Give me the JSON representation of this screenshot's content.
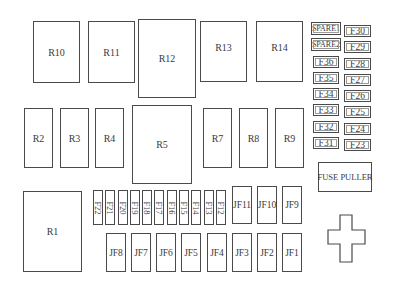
{
  "diagram": {
    "relays": [
      {
        "id": "R10",
        "x": 33,
        "y": 21,
        "w": 47,
        "h": 62
      },
      {
        "id": "R11",
        "x": 88,
        "y": 21,
        "w": 47,
        "h": 62
      },
      {
        "id": "R12",
        "x": 138,
        "y": 19,
        "w": 58,
        "h": 79
      },
      {
        "id": "R13",
        "x": 200,
        "y": 21,
        "w": 47,
        "h": 61
      },
      {
        "id": "R14",
        "x": 256,
        "y": 21,
        "w": 47,
        "h": 61
      },
      {
        "id": "R2",
        "x": 24,
        "y": 108,
        "w": 29,
        "h": 60
      },
      {
        "id": "R3",
        "x": 60,
        "y": 108,
        "w": 29,
        "h": 60
      },
      {
        "id": "R4",
        "x": 95,
        "y": 108,
        "w": 29,
        "h": 60
      },
      {
        "id": "R5",
        "x": 132,
        "y": 105,
        "w": 60,
        "h": 79
      },
      {
        "id": "R7",
        "x": 203,
        "y": 108,
        "w": 29,
        "h": 60
      },
      {
        "id": "R8",
        "x": 239,
        "y": 108,
        "w": 29,
        "h": 60
      },
      {
        "id": "R9",
        "x": 275,
        "y": 108,
        "w": 29,
        "h": 60
      },
      {
        "id": "R1",
        "x": 23,
        "y": 191,
        "w": 59,
        "h": 81
      }
    ],
    "mini_fuses_left_column": [
      "SPARE1",
      "SPARE2",
      "F36",
      "F35",
      "F34",
      "F33",
      "F32",
      "F31"
    ],
    "mini_fuses_right_column": [
      "F30",
      "F29",
      "F28",
      "F27",
      "F26",
      "F25",
      "F24",
      "F23"
    ],
    "vertical_fuses": [
      "F22",
      "F21",
      "F20",
      "F19",
      "F18",
      "F17",
      "F16",
      "F15",
      "F14",
      "F13",
      "F12"
    ],
    "jcase_fuses_top": [
      "JF11",
      "JF10",
      "JF9"
    ],
    "jcase_fuses_bottom": [
      "JF8",
      "JF7",
      "JF6",
      "JF5",
      "JF4",
      "JF3",
      "JF2",
      "JF1"
    ],
    "fuse_puller_label": "FUSE PULLER",
    "cross_shape": "plus-shaped-slot"
  },
  "labels": {
    "R10": "R10",
    "R11": "R11",
    "R12": "R12",
    "R13": "R13",
    "R14": "R14",
    "R2": "R2",
    "R3": "R3",
    "R4": "R4",
    "R5": "R5",
    "R7": "R7",
    "R8": "R8",
    "R9": "R9",
    "R1": "R1",
    "SPARE1": "SPARE1",
    "SPARE2": "SPARE2",
    "F36": "F36",
    "F35": "F35",
    "F34": "F34",
    "F33": "F33",
    "F32": "F32",
    "F31": "F31",
    "F30": "F30",
    "F29": "F29",
    "F28": "F28",
    "F27": "F27",
    "F26": "F26",
    "F25": "F25",
    "F24": "F24",
    "F23": "F23",
    "F22": "F22",
    "F21": "F21",
    "F20": "F20",
    "F19": "F19",
    "F18": "F18",
    "F17": "F17",
    "F16": "F16",
    "F15": "F15",
    "F14": "F14",
    "F13": "F13",
    "F12": "F12",
    "JF11": "JF11",
    "JF10": "JF10",
    "JF9": "JF9",
    "JF8": "JF8",
    "JF7": "JF7",
    "JF6": "JF6",
    "JF5": "JF5",
    "JF4": "JF4",
    "JF3": "JF3",
    "JF2": "JF2",
    "JF1": "JF1",
    "fuse_puller": "FUSE PULLER"
  }
}
